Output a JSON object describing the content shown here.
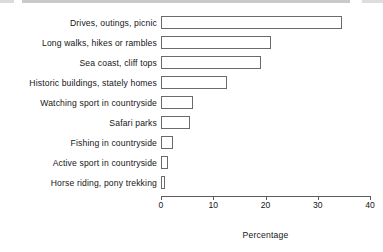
{
  "chart_data": {
    "type": "bar",
    "orientation": "horizontal",
    "title": "",
    "xlabel": "Percentage",
    "ylabel": "",
    "xlim": [
      0,
      40
    ],
    "xticks": [
      0,
      10,
      20,
      30,
      40
    ],
    "xtick_labels": [
      "0",
      "10",
      "20",
      "30",
      "40"
    ],
    "grid": false,
    "legend": false,
    "bar_style": {
      "fill": "#ffffff",
      "edge": "#6a6a6a"
    },
    "axis_color": "#5c5c5c",
    "categories": [
      "Drives, outings, picnic",
      "Long walks, hikes or rambles",
      "Sea coast, cliff tops",
      "Historic buildings, stately homes",
      "Watching sport in countryside",
      "Safari parks",
      "Fishing in countryside",
      "Active sport in countryside",
      "Horse riding, pony trekking"
    ],
    "values": [
      34.7,
      21.1,
      19.2,
      12.6,
      6.1,
      5.6,
      2.3,
      1.4,
      0.7
    ]
  }
}
